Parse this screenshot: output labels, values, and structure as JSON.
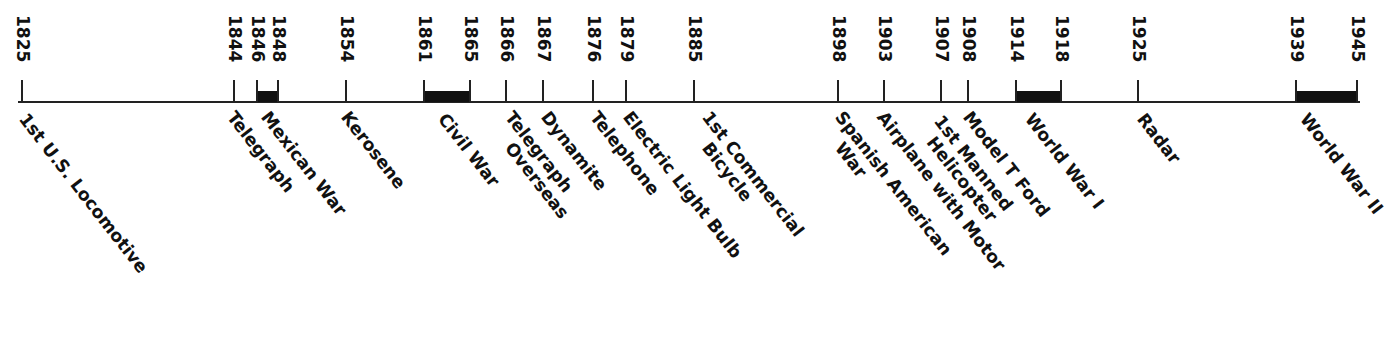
{
  "chart_data": {
    "type": "timeline",
    "title": "",
    "axis": {
      "start_year": 1825,
      "end_year": 1945,
      "orientation": "horizontal",
      "year_labels_rotated": 90,
      "event_labels_rotated": 52
    },
    "ticks": [
      {
        "year": "1825",
        "x": 22
      },
      {
        "year": "1844",
        "x": 234
      },
      {
        "year": "1846",
        "x": 257
      },
      {
        "year": "1848",
        "x": 278
      },
      {
        "year": "1854",
        "x": 346
      },
      {
        "year": "1861",
        "x": 424
      },
      {
        "year": "1865",
        "x": 470
      },
      {
        "year": "1866",
        "x": 506
      },
      {
        "year": "1867",
        "x": 543
      },
      {
        "year": "1876",
        "x": 593
      },
      {
        "year": "1879",
        "x": 626
      },
      {
        "year": "1885",
        "x": 694
      },
      {
        "year": "1898",
        "x": 838
      },
      {
        "year": "1903",
        "x": 884
      },
      {
        "year": "1907",
        "x": 941
      },
      {
        "year": "1908",
        "x": 968
      },
      {
        "year": "1914",
        "x": 1016
      },
      {
        "year": "1918",
        "x": 1061
      },
      {
        "year": "1925",
        "x": 1138
      },
      {
        "year": "1939",
        "x": 1296
      },
      {
        "year": "1945",
        "x": 1357
      }
    ],
    "spans": [
      {
        "name": "Mexican War",
        "start": 1846,
        "end": 1848,
        "x1": 257,
        "x2": 278
      },
      {
        "name": "Civil War",
        "start": 1861,
        "end": 1865,
        "x1": 424,
        "x2": 470
      },
      {
        "name": "World War I",
        "start": 1914,
        "end": 1918,
        "x1": 1016,
        "x2": 1061
      },
      {
        "name": "World War II",
        "start": 1939,
        "end": 1945,
        "x1": 1296,
        "x2": 1357
      }
    ],
    "events": [
      {
        "year": 1825,
        "lines": [
          "1st U.S. Locomotive"
        ],
        "x": 30,
        "y": 110
      },
      {
        "year": 1844,
        "lines": [
          "Telegraph"
        ],
        "x": 238,
        "y": 108
      },
      {
        "year": 1846,
        "lines": [
          "Mexican War"
        ],
        "x": 272,
        "y": 108
      },
      {
        "year": 1854,
        "lines": [
          "Kerosene"
        ],
        "x": 352,
        "y": 108
      },
      {
        "year": 1861,
        "lines": [
          "Civil War"
        ],
        "x": 449,
        "y": 110
      },
      {
        "year": 1866,
        "lines": [
          "Telegraph",
          "    Overseas"
        ],
        "x": 516,
        "y": 108
      },
      {
        "year": 1867,
        "lines": [
          "Dynamite"
        ],
        "x": 552,
        "y": 108
      },
      {
        "year": 1876,
        "lines": [
          "Telephone"
        ],
        "x": 601,
        "y": 108
      },
      {
        "year": 1879,
        "lines": [
          "Electric Light Bulb"
        ],
        "x": 634,
        "y": 108
      },
      {
        "year": 1885,
        "lines": [
          "1st Commercial",
          "    Bicycle"
        ],
        "x": 713,
        "y": 108
      },
      {
        "year": 1898,
        "lines": [
          "Spanish American",
          "    War"
        ],
        "x": 846,
        "y": 108
      },
      {
        "year": 1903,
        "lines": [
          "Airplane with Motor"
        ],
        "x": 888,
        "y": 108
      },
      {
        "year": 1907,
        "lines": [
          "1st Manned",
          "  Helicopter"
        ],
        "x": 945,
        "y": 112
      },
      {
        "year": 1908,
        "lines": [
          "Model T Ford"
        ],
        "x": 974,
        "y": 108
      },
      {
        "year": 1914,
        "lines": [
          "World War I"
        ],
        "x": 1036,
        "y": 110
      },
      {
        "year": 1925,
        "lines": [
          "Radar"
        ],
        "x": 1148,
        "y": 110
      },
      {
        "year": 1939,
        "lines": [
          "World War II"
        ],
        "x": 1311,
        "y": 110
      }
    ],
    "colors": {
      "ink": "#111111",
      "background": "#ffffff"
    }
  }
}
